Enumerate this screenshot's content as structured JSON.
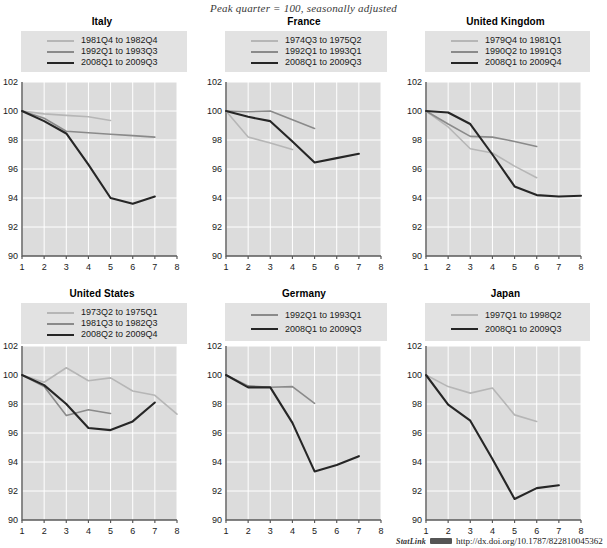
{
  "figure": {
    "subtitle": "Peak quarter = 100, seasonally adjusted",
    "source_note": {
      "label": "StatLink",
      "logo": "statlink-logo-icon",
      "url": "http://dx.doi.org/10.1787/822810045362"
    }
  },
  "axis": {
    "y_ticks": [
      "90",
      "92",
      "94",
      "96",
      "98",
      "100",
      "102"
    ],
    "x_ticks": [
      "1",
      "2",
      "3",
      "4",
      "5",
      "6",
      "7",
      "8"
    ],
    "ylim": [
      90,
      102
    ],
    "xlim": [
      1,
      8
    ],
    "grid": true
  },
  "colors": {
    "series_light": "#b6b6b6",
    "series_mid": "#8a8a8a",
    "series_dark": "#262626",
    "panel_background": "#dcdcdc",
    "legend_background": "#e2e2e2",
    "gridline": "#ffffff",
    "axis": "#5a5a5a"
  },
  "chart_data": [
    {
      "type": "line",
      "title": "Italy",
      "xlabel": "",
      "ylabel": "",
      "ylim": [
        90,
        102
      ],
      "x": [
        1,
        2,
        3,
        4,
        5,
        6,
        7,
        8
      ],
      "series": [
        {
          "name": "1981Q4 to 1982Q4",
          "color": "#b6b6b6",
          "values": [
            100.0,
            99.8,
            99.7,
            99.6,
            99.35,
            null,
            null,
            null
          ]
        },
        {
          "name": "1992Q1 to 1993Q3",
          "color": "#8a8a8a",
          "values": [
            100.0,
            99.5,
            98.6,
            98.5,
            98.4,
            98.3,
            98.2,
            null
          ]
        },
        {
          "name": "2008Q1 to 2009Q3",
          "color": "#262626",
          "values": [
            100.0,
            99.3,
            98.45,
            96.3,
            94.0,
            93.6,
            94.1,
            null
          ]
        }
      ]
    },
    {
      "type": "line",
      "title": "France",
      "xlabel": "",
      "ylabel": "",
      "ylim": [
        90,
        102
      ],
      "x": [
        1,
        2,
        3,
        4,
        5,
        6,
        7,
        8
      ],
      "series": [
        {
          "name": "1974Q3 to 1975Q2",
          "color": "#b6b6b6",
          "values": [
            100.0,
            98.2,
            97.8,
            97.35,
            null,
            null,
            null,
            null
          ]
        },
        {
          "name": "1992Q1 to 1993Q1",
          "color": "#8a8a8a",
          "values": [
            100.0,
            99.95,
            100.0,
            99.4,
            98.8,
            null,
            null,
            null
          ]
        },
        {
          "name": "2008Q1 to 2009Q3",
          "color": "#262626",
          "values": [
            100.0,
            99.6,
            99.3,
            97.9,
            96.45,
            96.75,
            97.05,
            null
          ]
        }
      ]
    },
    {
      "type": "line",
      "title": "United Kingdom",
      "xlabel": "",
      "ylabel": "",
      "ylim": [
        90,
        102
      ],
      "x": [
        1,
        2,
        3,
        4,
        5,
        6,
        7,
        8
      ],
      "series": [
        {
          "name": "1979Q4 to 1981Q1",
          "color": "#b6b6b6",
          "values": [
            100.0,
            98.9,
            97.4,
            97.1,
            96.2,
            95.4,
            null,
            null
          ]
        },
        {
          "name": "1990Q2 to 1991Q3",
          "color": "#8a8a8a",
          "values": [
            100.0,
            99.1,
            98.25,
            98.2,
            97.9,
            97.55,
            null,
            null
          ]
        },
        {
          "name": "2008Q1 to 2009Q4",
          "color": "#262626",
          "values": [
            100.0,
            99.9,
            99.1,
            97.0,
            94.8,
            94.2,
            94.1,
            94.15
          ]
        }
      ]
    },
    {
      "type": "line",
      "title": "United States",
      "xlabel": "",
      "ylabel": "",
      "ylim": [
        90,
        102
      ],
      "x": [
        1,
        2,
        3,
        4,
        5,
        6,
        7,
        8
      ],
      "series": [
        {
          "name": "1973Q2 to 1975Q1",
          "color": "#b6b6b6",
          "values": [
            100.0,
            99.5,
            100.5,
            99.6,
            99.8,
            98.9,
            98.6,
            97.3
          ]
        },
        {
          "name": "1981Q3 to 1982Q3",
          "color": "#8a8a8a",
          "values": [
            100.0,
            99.2,
            97.2,
            97.6,
            97.35,
            null,
            null,
            null
          ]
        },
        {
          "name": "2008Q2 to 2009Q4",
          "color": "#262626",
          "values": [
            100.0,
            99.3,
            98.0,
            96.35,
            96.2,
            96.8,
            98.1,
            null
          ]
        }
      ]
    },
    {
      "type": "line",
      "title": "Germany",
      "xlabel": "",
      "ylabel": "",
      "ylim": [
        90,
        102
      ],
      "x": [
        1,
        2,
        3,
        4,
        5,
        6,
        7,
        8
      ],
      "series": [
        {
          "name": "1992Q1 to 1993Q1",
          "color": "#8a8a8a",
          "values": [
            100.0,
            99.25,
            99.15,
            99.2,
            98.05,
            null,
            null,
            null
          ]
        },
        {
          "name": "2008Q1 to 2009Q3",
          "color": "#262626",
          "values": [
            100.0,
            99.15,
            99.15,
            96.7,
            93.35,
            93.8,
            94.4,
            null
          ]
        }
      ]
    },
    {
      "type": "line",
      "title": "Japan",
      "xlabel": "",
      "ylabel": "",
      "ylim": [
        90,
        102
      ],
      "x": [
        1,
        2,
        3,
        4,
        5,
        6,
        7,
        8
      ],
      "series": [
        {
          "name": "1997Q1 to 1998Q2",
          "color": "#b6b6b6",
          "values": [
            100.0,
            99.2,
            98.75,
            99.1,
            97.25,
            96.8,
            null,
            null
          ]
        },
        {
          "name": "2008Q1 to 2009Q3",
          "color": "#262626",
          "values": [
            100.0,
            97.95,
            96.85,
            94.2,
            91.45,
            92.2,
            92.4,
            null
          ]
        }
      ]
    }
  ]
}
